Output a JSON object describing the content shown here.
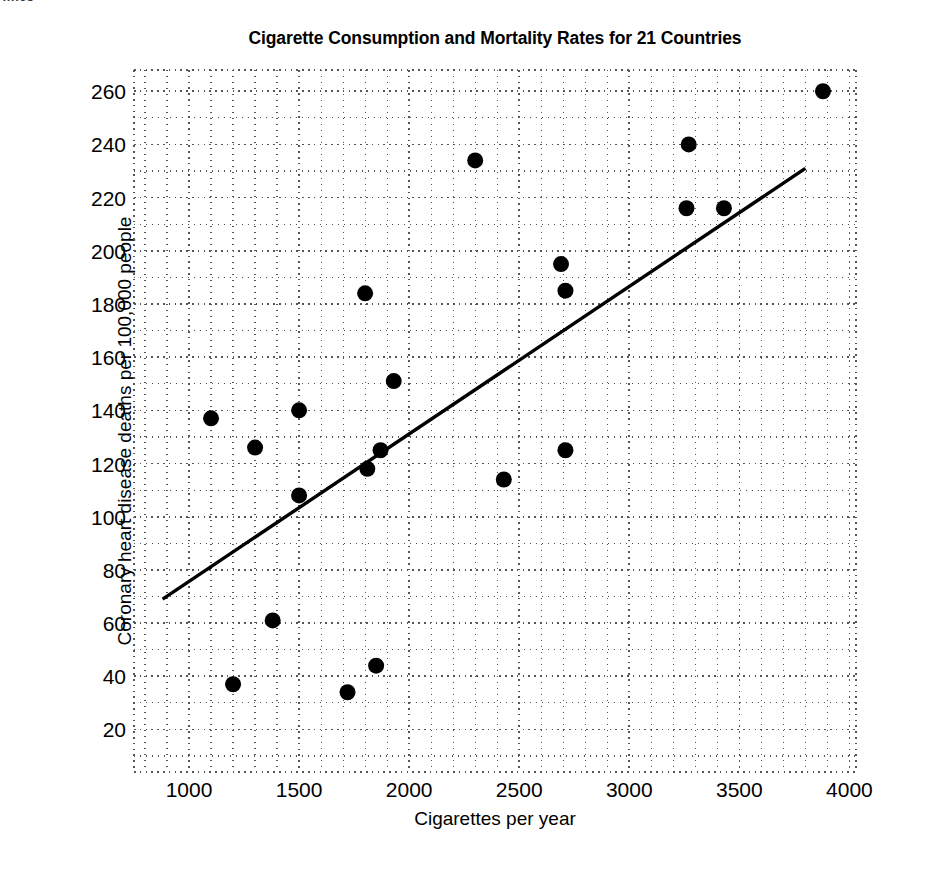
{
  "page_header_fragment": "…ics",
  "chart_data": {
    "type": "scatter",
    "title": "Cigarette Consumption and Mortality Rates for 21 Countries",
    "xlabel": "Cigarettes per year",
    "ylabel": "Coronary heart disease deaths per 100,000 people",
    "xlim": [
      750,
      4030
    ],
    "ylim": [
      4,
      268
    ],
    "xticks": [
      1000,
      1500,
      2000,
      2500,
      3000,
      3500,
      4000
    ],
    "yticks": [
      20,
      40,
      60,
      80,
      100,
      120,
      140,
      160,
      180,
      200,
      220,
      240,
      260
    ],
    "x_minor_step": 100,
    "y_minor_step": 10,
    "grid": "dotted-major-and-minor",
    "legend": "none",
    "marker": "filled-circle",
    "marker_color": "#000000",
    "n_points": 21,
    "points": [
      {
        "x": 1100,
        "y": 137
      },
      {
        "x": 1200,
        "y": 37
      },
      {
        "x": 1300,
        "y": 126
      },
      {
        "x": 1380,
        "y": 61
      },
      {
        "x": 1500,
        "y": 140
      },
      {
        "x": 1500,
        "y": 108
      },
      {
        "x": 1720,
        "y": 34
      },
      {
        "x": 1800,
        "y": 184
      },
      {
        "x": 1810,
        "y": 118
      },
      {
        "x": 1850,
        "y": 44
      },
      {
        "x": 1870,
        "y": 125
      },
      {
        "x": 1930,
        "y": 151
      },
      {
        "x": 2300,
        "y": 234
      },
      {
        "x": 2430,
        "y": 114
      },
      {
        "x": 2690,
        "y": 195
      },
      {
        "x": 2710,
        "y": 185
      },
      {
        "x": 2710,
        "y": 125
      },
      {
        "x": 3260,
        "y": 216
      },
      {
        "x": 3270,
        "y": 240
      },
      {
        "x": 3430,
        "y": 216
      },
      {
        "x": 3880,
        "y": 260
      }
    ],
    "trend_line": {
      "type": "linear-fit",
      "x_start": 880,
      "y_start": 69,
      "x_end": 3800,
      "y_end": 231,
      "color": "#000000"
    }
  }
}
